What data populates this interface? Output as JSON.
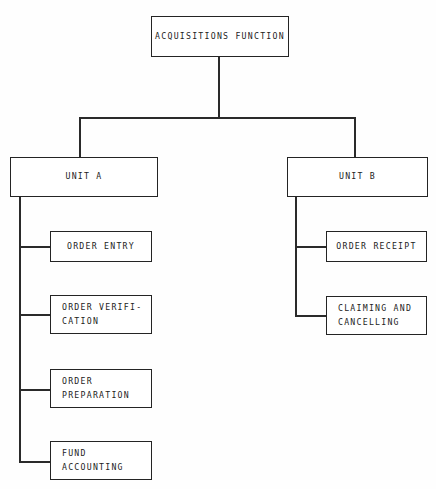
{
  "diagram": {
    "type": "organizational-hierarchy",
    "root": {
      "id": "acquisitions-function",
      "label": "ACQUISITIONS FUNCTION"
    },
    "units": [
      {
        "id": "unit-a",
        "label": "UNIT A",
        "children": [
          {
            "id": "order-entry",
            "label": "ORDER ENTRY",
            "align": "center"
          },
          {
            "id": "order-verification",
            "label": "ORDER VERIFI-\nCATION",
            "align": "left"
          },
          {
            "id": "order-preparation",
            "label": "ORDER\nPREPARATION",
            "align": "left"
          },
          {
            "id": "fund-accounting",
            "label": "FUND\nACCOUNTING",
            "align": "left"
          }
        ]
      },
      {
        "id": "unit-b",
        "label": "UNIT B",
        "children": [
          {
            "id": "order-receipt",
            "label": "ORDER RECEIPT",
            "align": "center"
          },
          {
            "id": "claiming-and-cancelling",
            "label": "CLAIMING AND\nCANCELLING",
            "align": "left"
          }
        ]
      }
    ],
    "colors": {
      "background": "#fefefe",
      "box_border": "#242424",
      "box_fill": "#ffffff",
      "text": "#1c1c1c",
      "connector": "#2a2a2a"
    }
  }
}
